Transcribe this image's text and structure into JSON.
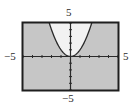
{
  "chart_data": {
    "type": "area",
    "title": "",
    "function": "y = x^2",
    "shaded_region": "y <= x^2",
    "xlabel": "",
    "ylabel": "",
    "xlim": [
      -5,
      5
    ],
    "ylim": [
      -5,
      5
    ],
    "x_tick_step": 1,
    "y_tick_step": 1,
    "grid": false,
    "legend": null,
    "axis_labels": {
      "x_min": "−5",
      "x_max": "5",
      "y_min": "−5",
      "y_max": "5"
    },
    "x": [
      -2.236,
      -2,
      -1.5,
      -1,
      -0.5,
      0,
      0.5,
      1,
      1.5,
      2,
      2.236
    ],
    "series": [
      {
        "name": "y = x^2",
        "values": [
          5,
          4,
          2.25,
          1,
          0.25,
          0,
          0.25,
          1,
          2.25,
          4,
          5
        ]
      }
    ],
    "colors": {
      "shaded": "#c6c6c6",
      "unshaded": "#f2f2f2",
      "frame": "#1e1e1e",
      "axes": "#2a2a2a",
      "curve": "#2a2a2a"
    }
  },
  "labels": {
    "top": "5",
    "bottom": "−5",
    "left": "−5",
    "right": "5"
  }
}
